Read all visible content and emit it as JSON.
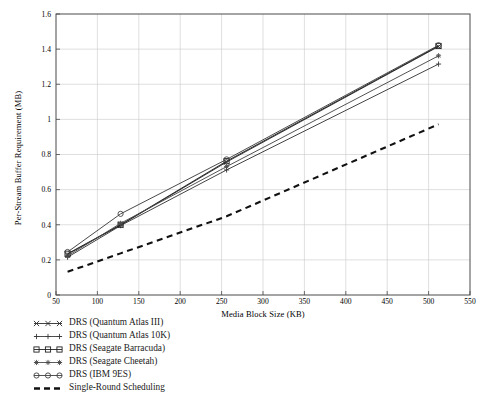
{
  "chart_data": {
    "type": "line",
    "title": "",
    "xlabel": "Media Block Size (KB)",
    "ylabel": "Per-Stream Buffer Requirement (MB)",
    "xlim": [
      50,
      550
    ],
    "ylim": [
      0,
      1.6
    ],
    "xticks": [
      50,
      100,
      150,
      200,
      250,
      300,
      350,
      400,
      450,
      500,
      550
    ],
    "yticks": [
      0,
      0.2,
      0.4,
      0.6,
      0.8,
      1,
      1.2,
      1.4,
      1.6
    ],
    "xtick_labels": [
      "50",
      "100",
      "150",
      "200",
      "250",
      "300",
      "350",
      "400",
      "450",
      "500",
      "550"
    ],
    "ytick_labels": [
      "0",
      "0.2",
      "0.4",
      "0.6",
      "0.8",
      "1",
      "1.2",
      "1.4",
      "1.6"
    ],
    "grid": true,
    "legend_position": "below-left",
    "x": [
      64,
      128,
      256,
      512
    ],
    "series": [
      {
        "name": "DRS (Quantum Atlas III)",
        "marker": "x-marker",
        "line": "solid",
        "color": "#2b2b2b",
        "values": [
          0.232,
          0.398,
          0.757,
          1.415
        ]
      },
      {
        "name": "DRS (Quantum Atlas 10K)",
        "marker": "plus-marker",
        "line": "solid",
        "color": "#3a3a3a",
        "values": [
          0.215,
          0.395,
          0.712,
          1.315
        ]
      },
      {
        "name": "DRS (Seagate Barracuda)",
        "marker": "square-marker",
        "line": "solid",
        "color": "#222222",
        "values": [
          0.235,
          0.4,
          0.762,
          1.418
        ]
      },
      {
        "name": "DRS (Seagate Cheetah)",
        "marker": "asterisk-marker",
        "line": "solid",
        "color": "#4a4a4a",
        "values": [
          0.222,
          0.408,
          0.731,
          1.362
        ]
      },
      {
        "name": "DRS (IBM 9ES)",
        "marker": "circle-marker",
        "line": "solid",
        "color": "#3f3f3f",
        "values": [
          0.245,
          0.462,
          0.772,
          1.422
        ]
      },
      {
        "name": "Single-Round Scheduling",
        "marker": "none",
        "line": "dashed",
        "color": "#111111",
        "values": [
          0.132,
          0.237,
          0.448,
          0.972
        ]
      }
    ]
  },
  "legend": {
    "items": [
      {
        "label": "DRS (Quantum Atlas III)"
      },
      {
        "label": "DRS (Quantum Atlas 10K)"
      },
      {
        "label": "DRS (Seagate Barracuda)"
      },
      {
        "label": "DRS (Seagate Cheetah)"
      },
      {
        "label": "DRS (IBM 9ES)"
      },
      {
        "label": "Single-Round Scheduling"
      }
    ]
  }
}
